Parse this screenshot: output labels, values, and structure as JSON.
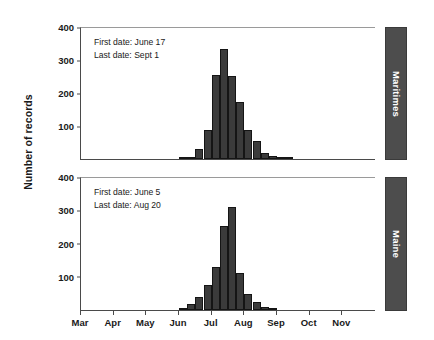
{
  "figure": {
    "ylabel": "Number of records",
    "x_axis": {
      "ticks": [
        "Mar",
        "Apr",
        "May",
        "Jun",
        "Jul",
        "Aug",
        "Sep",
        "Oct",
        "Nov"
      ],
      "tick_positions_month_index": [
        0,
        1,
        2,
        3,
        4,
        5,
        6,
        7,
        8
      ]
    },
    "y_axis": {
      "ticks": [
        "100",
        "200",
        "300",
        "400"
      ],
      "values": [
        100,
        200,
        300,
        400
      ],
      "limits": [
        0,
        400
      ]
    },
    "panels": [
      {
        "id": "maritimes",
        "strip_label": "Maritimes",
        "annotation": {
          "first_date_label": "First date: June 17",
          "last_date_label": "Last date: Sept 1"
        }
      },
      {
        "id": "maine",
        "strip_label": "Maine",
        "annotation": {
          "first_date_label": "First date: June 5",
          "last_date_label": "Last date: Aug 20"
        }
      }
    ],
    "colors": {
      "bar_fill": "#3b3b3b",
      "bar_edge": "#151515",
      "strip_fill": "#4d4d4d",
      "strip_text": "#ffffff",
      "axis": "#4a4a4a",
      "background": "#ffffff"
    }
  },
  "chart_data": [
    {
      "type": "bar",
      "title": "Maritimes",
      "xlabel": "",
      "ylabel": "Number of records",
      "ylim": [
        0,
        400
      ],
      "xlim_months": [
        2.0,
        11.0
      ],
      "grid": false,
      "legend": "none",
      "annotations": [
        "First date: June 17",
        "Last date: Sept 1"
      ],
      "x_tick_labels": [
        "Mar",
        "Apr",
        "May",
        "Jun",
        "Jul",
        "Aug",
        "Sep",
        "Oct",
        "Nov"
      ],
      "y_tick_labels": [
        "100",
        "200",
        "300",
        "400"
      ],
      "bin_unit": "week",
      "categories": [
        "Jun w1",
        "Jun w2",
        "Jun w3",
        "Jun w4",
        "Jul w1",
        "Jul w2",
        "Jul w3",
        "Jul w4",
        "Aug w1",
        "Aug w2",
        "Aug w3",
        "Aug w4",
        "Sep w1",
        "Sep w2"
      ],
      "bin_start_months": [
        5.0,
        5.25,
        5.5,
        5.75,
        6.0,
        6.25,
        6.5,
        6.75,
        7.0,
        7.25,
        7.5,
        7.75,
        8.0,
        8.25
      ],
      "values": [
        4,
        6,
        30,
        90,
        257,
        337,
        255,
        176,
        88,
        54,
        20,
        10,
        4,
        2
      ]
    },
    {
      "type": "bar",
      "title": "Maine",
      "xlabel": "",
      "ylabel": "Number of records",
      "ylim": [
        0,
        400
      ],
      "xlim_months": [
        2.0,
        11.0
      ],
      "grid": false,
      "legend": "none",
      "annotations": [
        "First date: June 5",
        "Last date: Aug 20"
      ],
      "x_tick_labels": [
        "Mar",
        "Apr",
        "May",
        "Jun",
        "Jul",
        "Aug",
        "Sep",
        "Oct",
        "Nov"
      ],
      "y_tick_labels": [
        "100",
        "200",
        "300",
        "400"
      ],
      "bin_unit": "week",
      "categories": [
        "Jun w1",
        "Jun w2",
        "Jun w3",
        "Jun w4",
        "Jul w1",
        "Jul w2",
        "Jul w3",
        "Jul w4",
        "Aug w1",
        "Aug w2",
        "Aug w3",
        "Aug w4"
      ],
      "bin_start_months": [
        5.0,
        5.25,
        5.5,
        5.75,
        6.0,
        6.25,
        6.5,
        6.75,
        7.0,
        7.25,
        7.5,
        7.75
      ],
      "values": [
        5,
        18,
        40,
        75,
        130,
        258,
        315,
        113,
        48,
        24,
        8,
        4
      ]
    }
  ]
}
